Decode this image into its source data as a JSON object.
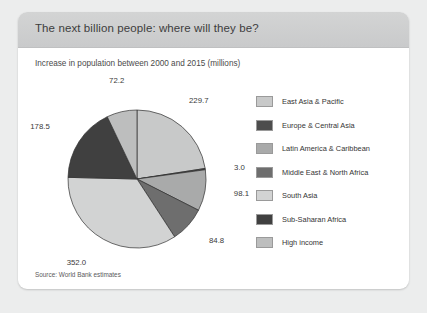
{
  "card": {
    "title": "The next billion people: where will they be?",
    "subtitle": "Increase in population between 2000 and 2015 (millions)",
    "source": "Source: World Bank estimates"
  },
  "chart_data": {
    "type": "pie",
    "title": "The next billion people: where will they be?",
    "subtitle": "Increase in population between 2000 and 2015 (millions)",
    "units": "millions",
    "start_angle_deg": 0,
    "direction": "clockwise",
    "legend_position": "right",
    "grid": false,
    "total": 1020.3,
    "categories": [
      "East Asia & Pacific",
      "Europe & Central Asia",
      "Latin America & Caribbean",
      "Middle East & North Africa",
      "South Asia",
      "Sub-Saharan Africa",
      "High income"
    ],
    "values": [
      229.7,
      3.0,
      98.1,
      84.8,
      352.0,
      178.5,
      72.2
    ],
    "labels": [
      "229.7",
      "3.0",
      "98.1",
      "84.8",
      "352.0",
      "178.5",
      "72.2"
    ],
    "colors": [
      "#c8c9c9",
      "#4d4d4d",
      "#a9aaaa",
      "#6e6e6e",
      "#d2d3d3",
      "#404040",
      "#bdbebe"
    ]
  }
}
